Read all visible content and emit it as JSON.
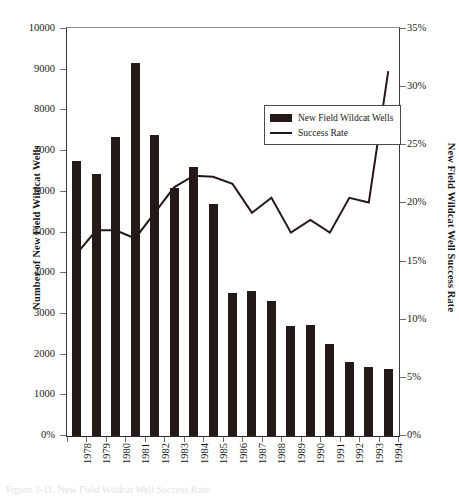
{
  "figure": {
    "top_title": "",
    "caption": "Figure 3-11.  New Field Wildcat Well Success Rate"
  },
  "legend": {
    "position": "inside-top-center",
    "items": [
      {
        "label": "New Field Wildcat Wells",
        "marker": "bar-swatch",
        "color": "#231a18"
      },
      {
        "label": "Success Rate",
        "marker": "line-swatch",
        "color": "#231a18"
      }
    ]
  },
  "axes": {
    "left_title": "Number of New Field Wildcat Wells",
    "right_title": "New Field Wildcat Well Success Rate",
    "left_ticks": [
      "10000",
      "9000",
      "8000",
      "7000",
      "6000",
      "5000",
      "4000",
      "3000",
      "2000",
      "1000",
      "0%"
    ],
    "right_ticks": [
      "35%",
      "30%",
      "25%",
      "20%",
      "15%",
      "10%",
      "5%",
      "0%"
    ]
  },
  "chart_data": {
    "type": "bar",
    "title": "New Field Wildcat Well Success Rate",
    "xlabel": "",
    "ylabel": "Number of New Field Wildcat Wells",
    "y2label": "New Field Wildcat Well Success Rate",
    "categories": [
      "1978",
      "1979",
      "1980",
      "1981",
      "1982",
      "1983",
      "1984",
      "1985",
      "1986",
      "1987",
      "1988",
      "1989",
      "1990",
      "1991",
      "1992",
      "1993",
      "1994"
    ],
    "ylim": [
      0,
      10000
    ],
    "y2lim": [
      0,
      35
    ],
    "grid": false,
    "legend_position": "upper center",
    "series": [
      {
        "name": "New Field Wildcat Wells",
        "type": "bar",
        "axis": "left",
        "color": "#231a18",
        "values": [
          6750,
          6450,
          7350,
          9170,
          7400,
          6100,
          6600,
          5700,
          3520,
          3570,
          3320,
          2700,
          2720,
          2250,
          1820,
          1700,
          1650
        ]
      },
      {
        "name": "Success Rate",
        "type": "line",
        "axis": "right",
        "color": "#231a18",
        "unit": "%",
        "values": [
          15.6,
          17.6,
          17.6,
          16.9,
          19.1,
          21.3,
          22.3,
          22.2,
          21.6,
          19.1,
          20.4,
          17.4,
          18.5,
          17.4,
          20.4,
          20.0,
          31.3
        ]
      }
    ]
  }
}
